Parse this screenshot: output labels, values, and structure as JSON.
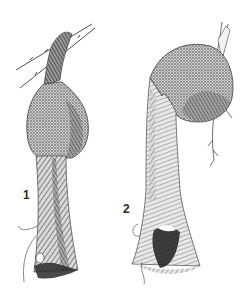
{
  "illustration": {
    "style": "pen-and-ink stippled drawing",
    "ink_color": "#1e1e1e",
    "paper_color": "#ffffff",
    "figures": [
      {
        "label": "1",
        "subject": "hanging nest with bulbous chamber and long entrance tube, attached to twigs at top"
      },
      {
        "label": "2",
        "subject": "hanging nest with curved rounded chamber and long flared entrance tube, attached to upright stem"
      }
    ]
  }
}
